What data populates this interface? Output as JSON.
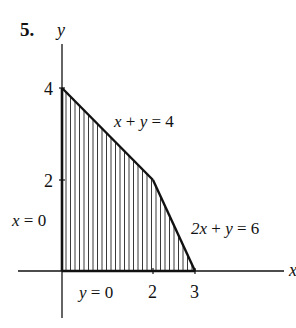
{
  "problem_number": "5.",
  "axes": {
    "x_label": "x",
    "y_label": "y",
    "x_ticks": [
      "2",
      "3"
    ],
    "y_ticks": [
      "4",
      "2"
    ]
  },
  "boundaries": {
    "line1": {
      "lhs_a": "x",
      "lhs_op": "+",
      "lhs_b": "y",
      "eq": "=",
      "rhs": "4"
    },
    "line2": {
      "lhs_a": "2x",
      "lhs_op": "+",
      "lhs_b": "y",
      "eq": "=",
      "rhs": "6"
    },
    "line3": {
      "lhs": "x",
      "eq": "=",
      "rhs": "0"
    },
    "line4": {
      "lhs": "y",
      "eq": "=",
      "rhs": "0"
    }
  },
  "region": {
    "vertices": [
      [
        0,
        0
      ],
      [
        0,
        4
      ],
      [
        2,
        2
      ],
      [
        3,
        0
      ]
    ],
    "fill": "vertical hatching",
    "stroke_color": "#111111"
  }
}
